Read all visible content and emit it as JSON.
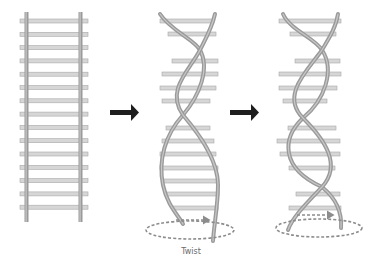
{
  "diagram": {
    "type": "dna-twisting-illustration",
    "stages": [
      {
        "name": "straight-ladder",
        "description": "Untwisted ladder with two parallel rails and 15 rungs"
      },
      {
        "name": "partial-twist",
        "description": "Ladder partially twisted into a helix"
      },
      {
        "name": "double-helix",
        "description": "Fully twisted double helix"
      }
    ],
    "arrows": [
      {
        "from": "straight-ladder",
        "to": "partial-twist",
        "icon": "right-arrow-icon"
      },
      {
        "from": "partial-twist",
        "to": "double-helix",
        "icon": "right-arrow-icon"
      }
    ],
    "labels": {
      "twist": "Twist"
    },
    "colors": {
      "rail": "#9a9a9a",
      "rail_highlight": "#c8c8c8",
      "rung": "#d6d6d6",
      "rung_edge": "#a8a8a8",
      "arrow": "#1e1e1e",
      "dashed": "#8c8c8c",
      "label": "#6b6b6b"
    }
  }
}
